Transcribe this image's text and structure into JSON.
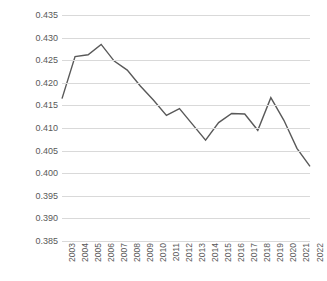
{
  "chart_data": {
    "type": "line",
    "title": "",
    "subtitle": "",
    "xlabel": "",
    "ylabel": "",
    "categories": [
      "2003",
      "2004",
      "2005",
      "2006",
      "2007",
      "2008",
      "2009",
      "2010",
      "2011",
      "2012",
      "2013",
      "2014",
      "2015",
      "2016",
      "2017",
      "2018",
      "2019",
      "2020",
      "2021",
      "2022"
    ],
    "values": [
      0.4165,
      0.4258,
      0.4262,
      0.4285,
      0.4248,
      0.4228,
      0.4193,
      0.4162,
      0.4128,
      0.4143,
      0.4108,
      0.4073,
      0.4112,
      0.4132,
      0.4131,
      0.4095,
      0.4167,
      0.4117,
      0.4055,
      0.4015
    ],
    "series": [
      {
        "name": "series-1",
        "values": [
          0.4165,
          0.4258,
          0.4262,
          0.4285,
          0.4248,
          0.4228,
          0.4193,
          0.4162,
          0.4128,
          0.4143,
          0.4108,
          0.4073,
          0.4112,
          0.4132,
          0.4131,
          0.4095,
          0.4167,
          0.4117,
          0.4055,
          0.4015
        ]
      }
    ],
    "ylim": [
      0.385,
      0.435
    ],
    "ytick_step": 0.005,
    "ytick_labels": [
      "0.435",
      "0.430",
      "0.425",
      "0.420",
      "0.415",
      "0.410",
      "0.405",
      "0.400",
      "0.395",
      "0.390",
      "0.385"
    ],
    "ytick_values": [
      0.435,
      0.43,
      0.425,
      0.42,
      0.415,
      0.41,
      0.405,
      0.4,
      0.395,
      0.39,
      0.385
    ],
    "grid": true,
    "legend": false,
    "legend_position": "none",
    "markers": false,
    "colors": {
      "line": "#595959",
      "grid": "#d9d9d9",
      "text": "#595959",
      "background": "#ffffff"
    },
    "line_width": 1.4,
    "annotations": []
  }
}
